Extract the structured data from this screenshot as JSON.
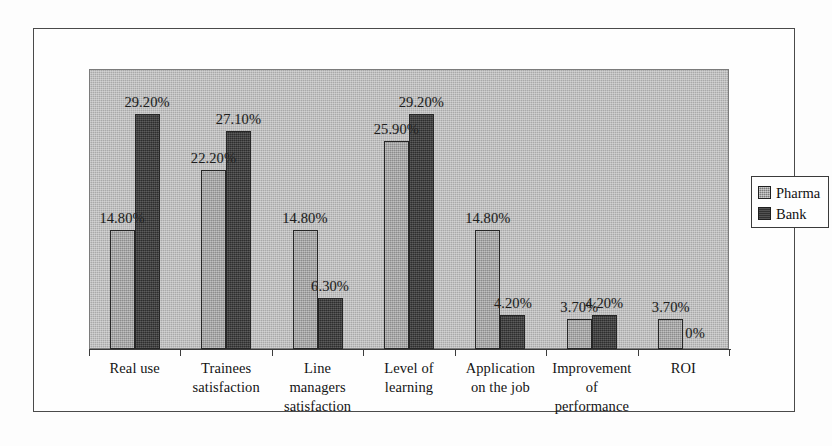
{
  "chart_data": {
    "type": "bar",
    "title": "",
    "xlabel": "",
    "ylabel": "",
    "ylim": [
      0,
      34.8
    ],
    "grid": false,
    "legend_position": "right",
    "categories": [
      "Real use",
      "Trainees satisfaction",
      "Line managers satisfaction",
      "Level of learning",
      "Application on the job",
      "Improvement of performance",
      "ROI"
    ],
    "category_lines": [
      [
        "Real use"
      ],
      [
        "Trainees",
        "satisfaction"
      ],
      [
        "Line",
        "managers",
        "satisfaction"
      ],
      [
        "Level of",
        "learning"
      ],
      [
        "Application",
        "on the job"
      ],
      [
        "Improvement",
        "of",
        "performance"
      ],
      [
        "ROI"
      ]
    ],
    "series": [
      {
        "name": "Pharma",
        "color": "#9c9c9c",
        "values": [
          14.8,
          22.2,
          14.8,
          25.9,
          14.8,
          3.7,
          3.7
        ],
        "labels": [
          "14.80%",
          "22.20%",
          "14.80%",
          "25.90%",
          "14.80%",
          "3.70%",
          "3.70%"
        ]
      },
      {
        "name": "Bank",
        "color": "#3b3b3b",
        "values": [
          29.2,
          27.1,
          6.3,
          29.2,
          4.2,
          4.2,
          0
        ],
        "labels": [
          "29.20%",
          "27.10%",
          "6.30%",
          "29.20%",
          "4.20%",
          "4.20%",
          "0%"
        ]
      }
    ]
  },
  "legend": {
    "items": [
      {
        "label": "Pharma",
        "swatch": "pharma"
      },
      {
        "label": "Bank",
        "swatch": "bank"
      }
    ]
  }
}
